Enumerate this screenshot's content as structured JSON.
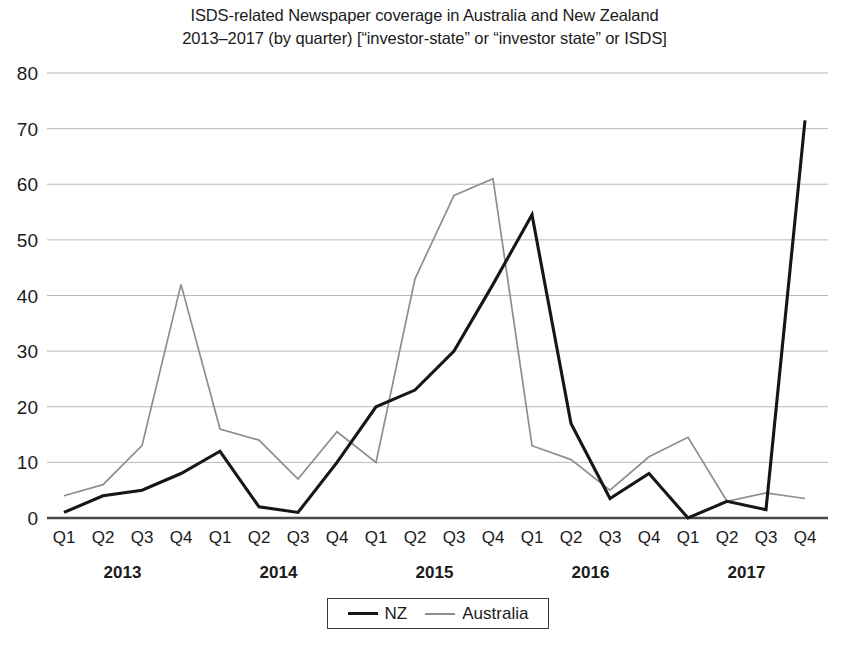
{
  "chart_data": {
    "type": "line",
    "title": "ISDS-related Newspaper coverage in Australia and New Zealand",
    "subtitle": "2013–2017 (by quarter) [“investor-state” or “investor state” or ISDS]",
    "title_lines": [
      "ISDS-related Newspaper coverage in Australia and New Zealand",
      "2013–2017 (by quarter) [“investor-state” or “investor state” or ISDS]"
    ],
    "xlabel": "",
    "ylabel": "",
    "ylim": [
      0,
      80
    ],
    "yticks": [
      0,
      10,
      20,
      30,
      40,
      50,
      60,
      70,
      80
    ],
    "ytick_labels": [
      "0",
      "10",
      "20",
      "30",
      "40",
      "50",
      "60",
      "70",
      "80"
    ],
    "grid": true,
    "legend_position": "bottom-center",
    "categories": [
      "Q1",
      "Q2",
      "Q3",
      "Q4",
      "Q1",
      "Q2",
      "Q3",
      "Q4",
      "Q1",
      "Q2",
      "Q3",
      "Q4",
      "Q1",
      "Q2",
      "Q3",
      "Q4",
      "Q1",
      "Q2",
      "Q3",
      "Q4"
    ],
    "year_groups": [
      {
        "year": "2013",
        "start_index": 0,
        "end_index": 3
      },
      {
        "year": "2014",
        "start_index": 4,
        "end_index": 7
      },
      {
        "year": "2015",
        "start_index": 8,
        "end_index": 11
      },
      {
        "year": "2016",
        "start_index": 12,
        "end_index": 15
      },
      {
        "year": "2017",
        "start_index": 16,
        "end_index": 19
      }
    ],
    "series": [
      {
        "name": "NZ",
        "color": "#161616",
        "values": [
          1,
          4,
          5,
          8,
          12,
          2,
          1,
          10,
          20,
          23,
          30,
          42,
          54.5,
          17,
          3.5,
          8,
          0,
          3,
          1.5,
          71.5
        ]
      },
      {
        "name": "Australia",
        "color": "#8e8e8e",
        "values": [
          4,
          6,
          13,
          42,
          16,
          14,
          7,
          15.5,
          10,
          43,
          58,
          61,
          13,
          10.5,
          5,
          11,
          14.5,
          3,
          4.5,
          3.5
        ]
      }
    ]
  },
  "legend": {
    "items": [
      {
        "label": "NZ",
        "color": "#161616"
      },
      {
        "label": "Australia",
        "color": "#8e8e8e"
      }
    ]
  }
}
